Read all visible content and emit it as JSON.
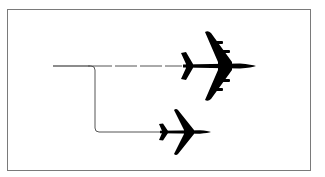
{
  "diagram": {
    "type": "flight-path-split",
    "colors": {
      "background": "#ffffff",
      "frame": "#7a7a7a",
      "aircraft": "#000000",
      "path": "#555555"
    },
    "elements": [
      {
        "id": "large-aircraft",
        "kind": "four-engine-jet",
        "center": [
          218,
          66
        ],
        "heading": "right"
      },
      {
        "id": "small-aircraft",
        "kind": "twin-engine-jet",
        "center": [
          185,
          132
        ],
        "heading": "right"
      },
      {
        "id": "dashed-path",
        "from": [
          53,
          66
        ],
        "to": [
          180,
          66
        ],
        "style": "dashed"
      },
      {
        "id": "elbow-path",
        "from": [
          53,
          66
        ],
        "via": [
          [
            95,
            66
          ],
          [
            95,
            132
          ]
        ],
        "to": [
          158,
          132
        ],
        "style": "solid"
      }
    ]
  }
}
